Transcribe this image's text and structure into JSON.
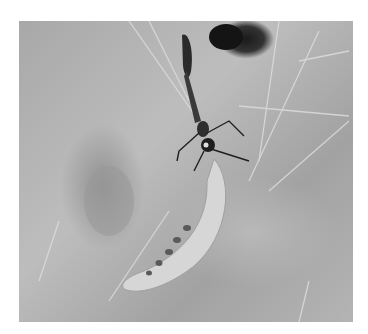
{
  "image": {
    "subject": "wasp dragging larva near burrow on sandy ground",
    "colors": {
      "background": "#ffffff",
      "soil": "#b0b0b0",
      "burrow": "#1a1a1a",
      "larva": "#d4d4d4",
      "wasp": "#2a2a2a"
    }
  }
}
